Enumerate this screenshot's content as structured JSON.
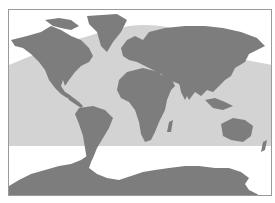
{
  "map": {
    "type": "world-map",
    "projection": "equirectangular",
    "labels": [],
    "colors": {
      "background": "#ffffff",
      "frame": "#9a9a9a",
      "land": "#7d7d7d",
      "shaded_band": "#d3d3d3"
    },
    "shaded_band": {
      "description": "light grey band across tropical/mid latitudes, curved top edge dipping toward the Atlantic, flat bottom edge in southern mid-latitudes"
    },
    "regions": [
      {
        "name": "north-america"
      },
      {
        "name": "greenland"
      },
      {
        "name": "south-america"
      },
      {
        "name": "europe-asia"
      },
      {
        "name": "africa"
      },
      {
        "name": "australia"
      },
      {
        "name": "antarctica"
      }
    ]
  }
}
